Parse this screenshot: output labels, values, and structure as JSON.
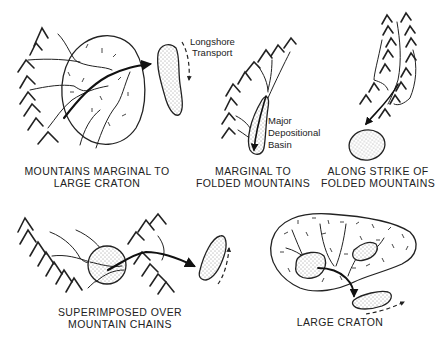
{
  "figure": {
    "panels": [
      {
        "id": "mountains-marginal-to-large-craton",
        "label_lines": [
          "MOUNTAINS MARGINAL TO",
          "LARGE CRATON"
        ],
        "annotations": [
          "Longshore",
          "Transport"
        ]
      },
      {
        "id": "marginal-to-folded-mountains",
        "label_lines": [
          "MARGINAL TO",
          "FOLDED MOUNTAINS"
        ],
        "annotations": [
          "Major",
          "Depositional",
          "Basin"
        ]
      },
      {
        "id": "along-strike-of-folded-mountains",
        "label_lines": [
          "ALONG STRIKE OF",
          "FOLDED MOUNTAINS"
        ],
        "annotations": []
      },
      {
        "id": "superimposed-over-mountain-chains",
        "label_lines": [
          "SUPERIMPOSED OVER",
          "MOUNTAIN CHAINS"
        ],
        "annotations": []
      },
      {
        "id": "large-craton",
        "label_lines": [
          "LARGE CRATON"
        ],
        "annotations": []
      }
    ],
    "colors": {
      "ink": "#222222",
      "background": "#ffffff"
    }
  }
}
